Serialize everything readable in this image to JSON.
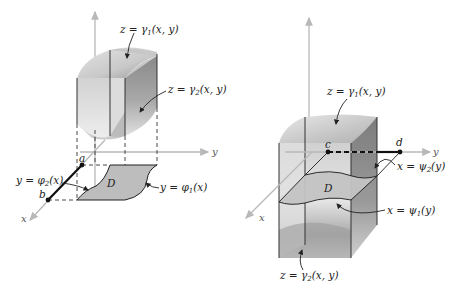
{
  "figure_left": {
    "axes": {
      "x": "x",
      "y": "y"
    },
    "labels": {
      "top_surface": {
        "prefix": "z = γ",
        "sub": "1",
        "suffix": "(x, y)"
      },
      "bottom_surface": {
        "prefix": "z = γ",
        "sub": "2",
        "suffix": "(x, y)"
      },
      "left_boundary": {
        "prefix": "y = φ",
        "sub": "2",
        "suffix": "(x)"
      },
      "right_boundary": {
        "prefix": "y = φ",
        "sub": "1",
        "suffix": "(x)"
      },
      "region": "D",
      "point_a": "a",
      "point_b": "b"
    }
  },
  "figure_right": {
    "axes": {
      "x": "x",
      "y": "y"
    },
    "labels": {
      "top_surface": {
        "prefix": "z = γ",
        "sub": "1",
        "suffix": "(x, y)"
      },
      "bottom_surface": {
        "prefix": "z = γ",
        "sub": "2",
        "suffix": "(x, y)"
      },
      "upper_boundary": {
        "prefix": "x = ψ",
        "sub": "2",
        "suffix": "(y)"
      },
      "lower_boundary": {
        "prefix": "x = ψ",
        "sub": "1",
        "suffix": "(y)"
      },
      "region": "D",
      "point_c": "c",
      "point_d": "d"
    }
  },
  "colors": {
    "axis": "#b8b8b8",
    "region_fill": "#bdbdbd",
    "solid_light": "#d9d9d9",
    "solid_dark": "#8f8f8f",
    "ink": "#222222"
  }
}
